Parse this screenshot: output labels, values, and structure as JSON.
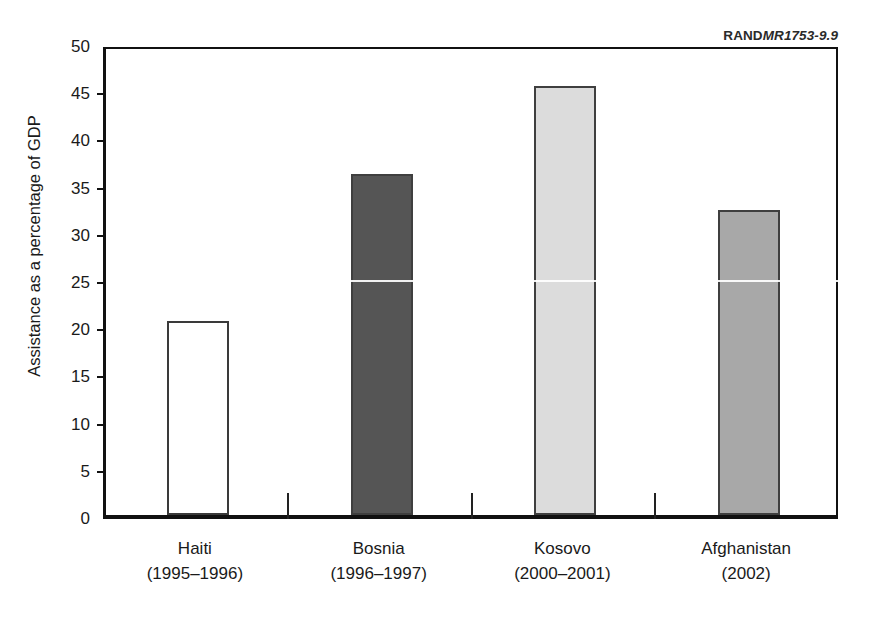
{
  "figure": {
    "source_credit": {
      "organization": "RAND",
      "document_id": "MR1753-9.9"
    }
  },
  "chart_data": {
    "type": "bar",
    "title": "",
    "xlabel": "",
    "ylabel": "Assistance as a percentage of GDP",
    "ylim": [
      0,
      50
    ],
    "yticks": [
      0,
      5,
      10,
      15,
      20,
      25,
      30,
      35,
      40,
      45,
      50
    ],
    "ytick_labels": [
      "0",
      "5",
      "10",
      "15",
      "20",
      "25",
      "30",
      "35",
      "40",
      "45",
      "50"
    ],
    "grid": false,
    "legend": false,
    "categories": [
      "Haiti",
      "Bosnia",
      "Kosovo",
      "Afghanistan"
    ],
    "category_periods": [
      "(1995–1996)",
      "(1996–1997)",
      "(2000–2001)",
      "(2002)"
    ],
    "values": [
      20.6,
      36.1,
      45.4,
      32.3
    ],
    "bar_colors": [
      "#ffffff",
      "#555555",
      "#dcdcdc",
      "#a8a8a8"
    ],
    "bar_edge_colors": [
      "#3a3a3a",
      "#3f3f3f",
      "#3f3f3f",
      "#3f3f3f"
    ],
    "bars": [
      {
        "category": "Haiti",
        "period": "(1995–1996)",
        "value": 20.6,
        "fill": "#ffffff",
        "style": "outline"
      },
      {
        "category": "Bosnia",
        "period": "(1996–1997)",
        "value": 36.1,
        "fill": "#555555",
        "style": "filled"
      },
      {
        "category": "Kosovo",
        "period": "(2000–2001)",
        "value": 45.4,
        "fill": "#dcdcdc",
        "style": "filled"
      },
      {
        "category": "Afghanistan",
        "period": "(2002)",
        "value": 32.3,
        "fill": "#a8a8a8",
        "style": "filled"
      }
    ]
  }
}
